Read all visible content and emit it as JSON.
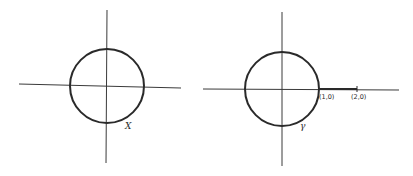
{
  "figures": [
    {
      "id": "left",
      "curve_label": "X",
      "points": []
    },
    {
      "id": "right",
      "curve_label": "γ",
      "points": [
        {
          "label": "(1,0)"
        },
        {
          "label": "(2,0)"
        }
      ]
    }
  ],
  "colors": {
    "ink": "#2a2a2a",
    "background": "#ffffff"
  }
}
